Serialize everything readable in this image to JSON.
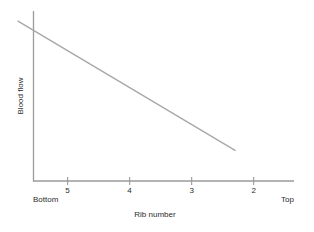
{
  "chart_data": {
    "type": "line",
    "title": "",
    "subtitle": "",
    "xlabel": "Rib number",
    "ylabel": "Blood flow",
    "x_tick_labels": [
      "5",
      "4",
      "3",
      "2"
    ],
    "x_tick_positions": [
      5,
      4,
      3,
      2
    ],
    "y_tick_labels": [],
    "xlim": [
      5.55,
      1.35
    ],
    "ylim": [
      0,
      1
    ],
    "x_axis_direction": "decreasing-left-to-right",
    "grid": false,
    "legend": false,
    "legend_position": "none",
    "axis_end_annotations": {
      "left": "Bottom",
      "right": "Top"
    },
    "series": [
      {
        "name": "Blood flow vs rib number",
        "style": "straight-line",
        "color": "#a8a8a8",
        "line_width": 1.4,
        "markers": false,
        "x": [
          5.8,
          2.3
        ],
        "y": [
          0.94,
          0.18
        ],
        "points": [
          {
            "x_rib": 5.8,
            "y_relative": 0.94
          },
          {
            "x_rib": 2.3,
            "y_relative": 0.18
          }
        ],
        "description": "Blood flow decreases linearly from bottom ribs to top ribs"
      }
    ],
    "axes_style": {
      "spine_color": "#9a9a9a",
      "spine_width": 1.3,
      "tick_color": "#9a9a9a",
      "tick_length": 8,
      "top_spine": false,
      "right_spine": false
    }
  }
}
